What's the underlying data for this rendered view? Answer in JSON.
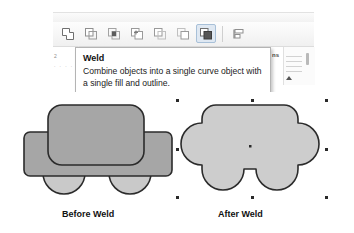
{
  "window": {
    "app_area_name": "drawing-application"
  },
  "toolbar": {
    "name": "shaping-toolbar",
    "buttons": [
      {
        "id": "weld",
        "label": "Weld",
        "icon": "weld-icon",
        "active": false
      },
      {
        "id": "trim",
        "label": "Trim",
        "icon": "trim-icon",
        "active": false
      },
      {
        "id": "intersect",
        "label": "Intersect",
        "icon": "intersect-icon",
        "active": false
      },
      {
        "id": "simplify",
        "label": "Simplify",
        "icon": "simplify-icon",
        "active": false
      },
      {
        "id": "front-minus-back",
        "label": "Front Minus Back",
        "icon": "front-minus-back-icon",
        "active": false
      },
      {
        "id": "back-minus-front",
        "label": "Back Minus Front",
        "icon": "back-minus-front-icon",
        "active": false
      },
      {
        "id": "boundary",
        "label": "Boundary",
        "icon": "boundary-icon",
        "active": true
      }
    ],
    "extra_buttons": [
      {
        "id": "align-distribute",
        "label": "Align and Distribute",
        "icon": "align-distribute-icon",
        "active": false
      }
    ]
  },
  "tooltip": {
    "name": "weld-tooltip",
    "title": "Weld",
    "description": "Combine objects into a single curve object with a single fill and outline."
  },
  "docker": {
    "partial_label": "ns"
  },
  "ruler": {
    "tick_label": "2",
    "tick_dots": ". . . ."
  },
  "illustration": {
    "before": {
      "caption": "Before Weld",
      "shapes": [
        {
          "name": "car-roof-rect",
          "fill": "#a6a6a6",
          "stroke": "#2b2b2b"
        },
        {
          "name": "car-body-rect",
          "fill": "#a6a6a6",
          "stroke": "#2b2b2b"
        },
        {
          "name": "wheel-left",
          "fill": "#c9c9c9",
          "stroke": "#2b2b2b"
        },
        {
          "name": "wheel-right",
          "fill": "#c9c9c9",
          "stroke": "#2b2b2b"
        }
      ]
    },
    "after": {
      "caption": "After Weld",
      "shapes": [
        {
          "name": "welded-car-outline",
          "fill": "#cdcdcd",
          "stroke": "#2b2b2b"
        }
      ],
      "selected": true,
      "handle_count": 8
    }
  },
  "colors": {
    "shape_fill_dark": "#a6a6a6",
    "shape_fill_light": "#c9c9c9",
    "welded_fill": "#cdcdcd",
    "outline": "#2b2b2b",
    "tooltip_bg": "#ffffff",
    "tooltip_border": "#b4b4b4",
    "toolbar_bg": "#f3f3f3",
    "handle": "#2a2a2a"
  }
}
